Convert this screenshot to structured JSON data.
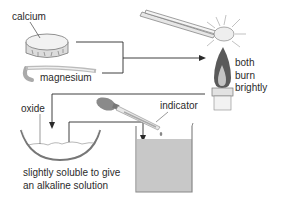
{
  "diagram": {
    "type": "chemistry-process",
    "labels": {
      "calcium": "calcium",
      "magnesium": "magnesium",
      "burn_lines": [
        "both",
        "burn",
        "brightly"
      ],
      "oxide": "oxide",
      "indicator": "indicator",
      "result_lines": [
        "slightly soluble to give",
        "an alkaline solution"
      ]
    },
    "colors": {
      "line": "#2a2a2a",
      "solution": "#c8c8c8",
      "glass": "#9a9a9a",
      "flame_outer": "#555555",
      "flame_inner": "#bdbdbd",
      "metal": "#e6e6e6"
    },
    "icons": [
      "calcium-disc-icon",
      "magnesium-ribbon-icon",
      "tongs-icon",
      "burning-metal-icon",
      "bunsen-burner-icon",
      "evaporating-dish-icon",
      "dropper-icon",
      "beaker-icon"
    ]
  }
}
